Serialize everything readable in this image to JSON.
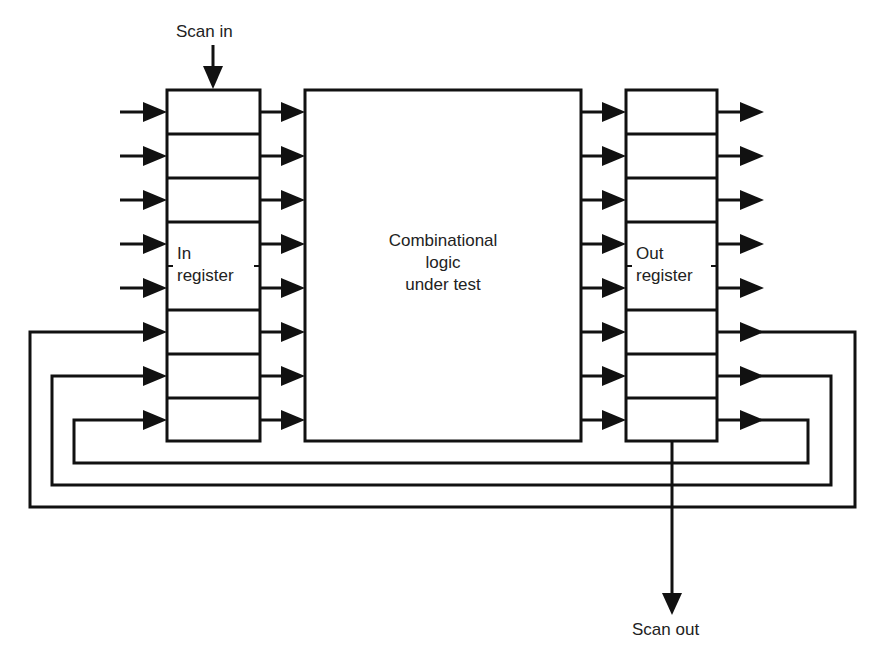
{
  "diagram": {
    "labels": {
      "scan_in": "Scan in",
      "scan_out": "Scan out",
      "in_register_line1": "In",
      "in_register_line2": "register",
      "out_register_line1": "Out",
      "out_register_line2": "register",
      "logic_line1": "Combinational",
      "logic_line2": "logic",
      "logic_line3": "under test"
    },
    "blocks": [
      {
        "id": "in-register",
        "label": "In register",
        "cells": 8
      },
      {
        "id": "combinational-logic",
        "label": "Combinational logic under test"
      },
      {
        "id": "out-register",
        "label": "Out register",
        "cells": 8
      }
    ],
    "signals": {
      "primary_inputs": 5,
      "parallel_paths": 8,
      "primary_outputs": 5,
      "feedback_loops": 3
    },
    "colors": {
      "line": "#111111",
      "background": "#ffffff",
      "text": "#222222"
    }
  }
}
